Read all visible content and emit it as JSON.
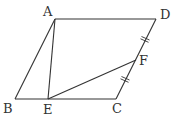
{
  "diagram": {
    "type": "geometry",
    "shape": "parallelogram",
    "points": {
      "A": {
        "label": "A",
        "x": 55,
        "y": 19,
        "lx": 43,
        "ly": 16
      },
      "B": {
        "label": "B",
        "x": 15,
        "y": 99,
        "lx": 3,
        "ly": 113
      },
      "C": {
        "label": "C",
        "x": 116,
        "y": 99,
        "lx": 112,
        "ly": 113
      },
      "D": {
        "label": "D",
        "x": 156,
        "y": 19,
        "lx": 160,
        "ly": 19
      },
      "E": {
        "label": "E",
        "x": 48,
        "y": 99,
        "lx": 43,
        "ly": 114
      },
      "F": {
        "label": "F",
        "x": 136,
        "y": 60,
        "lx": 139,
        "ly": 65
      }
    },
    "segments": [
      [
        "A",
        "D"
      ],
      [
        "D",
        "C"
      ],
      [
        "C",
        "B"
      ],
      [
        "B",
        "A"
      ],
      [
        "A",
        "E"
      ],
      [
        "E",
        "F"
      ]
    ],
    "equal_marks": [
      {
        "segment": [
          "D",
          "F"
        ],
        "marks": 2
      },
      {
        "segment": [
          "F",
          "C"
        ],
        "marks": 2
      }
    ]
  }
}
